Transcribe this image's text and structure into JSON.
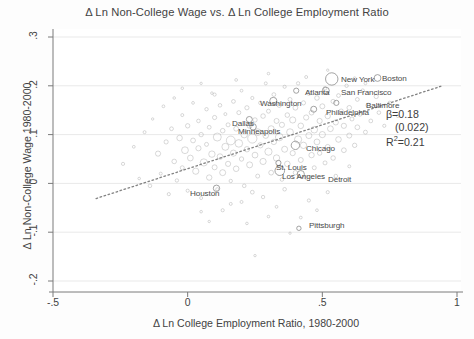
{
  "chart_data": {
    "type": "scatter",
    "title": "Δ Ln Non-College Wage vs. Δ Ln College Employment Ratio",
    "xlabel": "Δ Ln College Employment Ratio, 1980-2000",
    "ylabel": "Δ Ln Non-College Wage 1980-2000",
    "xlim": [
      -0.5,
      1.0
    ],
    "ylim": [
      -0.2,
      0.3
    ],
    "xticks": [
      "-.5",
      "0",
      ".5",
      "1"
    ],
    "xtick_values": [
      -0.5,
      0,
      0.5,
      1
    ],
    "yticks": [
      ".3",
      ".2",
      ".1",
      "0",
      "-.1",
      "-.2"
    ],
    "ytick_values": [
      0.3,
      0.2,
      0.1,
      0,
      -0.1,
      -0.2
    ],
    "grid": "horizontal",
    "legend": "none",
    "marker_style": "hollow-circle-weighted",
    "marker_color": "#9a9a9a",
    "fit_line": {
      "style": "dotted",
      "color": "#6e6e6e",
      "x0": -0.34,
      "y0": -0.031,
      "x1": 0.94,
      "y1": 0.199
    },
    "annotations": {
      "beta": "β=0.18",
      "se": "(0.022)",
      "r2_prefix": "R",
      "r2_sup": "2",
      "r2_value": "=0.21"
    },
    "labeled_points": [
      {
        "name": "New York",
        "x": 0.535,
        "y": 0.214,
        "r": 6.2,
        "lx": 341,
        "ly": 75
      },
      {
        "name": "Boston",
        "x": 0.705,
        "y": 0.216,
        "r": 3.4,
        "lx": 382,
        "ly": 74
      },
      {
        "name": "Atlanta",
        "x": 0.403,
        "y": 0.19,
        "r": 2.6,
        "lx": 305,
        "ly": 88
      },
      {
        "name": "San Francisco",
        "x": 0.513,
        "y": 0.19,
        "r": 3.5,
        "lx": 341,
        "ly": 88
      },
      {
        "name": "Washington",
        "x": 0.318,
        "y": 0.169,
        "r": 3.6,
        "lx": 260,
        "ly": 99
      },
      {
        "name": "Baltimore",
        "x": 0.552,
        "y": 0.165,
        "r": 2.6,
        "lx": 366,
        "ly": 101
      },
      {
        "name": "Philadelphia",
        "x": 0.468,
        "y": 0.152,
        "r": 3.0,
        "lx": 326,
        "ly": 108
      },
      {
        "name": "Dallas",
        "x": 0.229,
        "y": 0.131,
        "r": 3.0,
        "lx": 232,
        "ly": 119
      },
      {
        "name": "Minneapolis",
        "x": 0.243,
        "y": 0.116,
        "r": 3.2,
        "lx": 238,
        "ly": 127
      },
      {
        "name": "Chicago",
        "x": 0.4,
        "y": 0.078,
        "r": 4.2,
        "lx": 306,
        "ly": 144
      },
      {
        "name": "St. Louis",
        "x": 0.337,
        "y": 0.042,
        "r": 2.6,
        "lx": 276,
        "ly": 163
      },
      {
        "name": "Los Angeles",
        "x": 0.342,
        "y": 0.026,
        "r": 4.8,
        "lx": 282,
        "ly": 172
      },
      {
        "name": "Detroit",
        "x": 0.42,
        "y": 0.019,
        "r": 3.6,
        "lx": 328,
        "ly": 175
      },
      {
        "name": "Houston",
        "x": 0.107,
        "y": -0.01,
        "r": 3.2,
        "lx": 190,
        "ly": 189
      },
      {
        "name": "Pittsburgh",
        "x": 0.413,
        "y": -0.092,
        "r": 2.2,
        "lx": 309,
        "ly": 221
      }
    ],
    "points": [
      {
        "x": -0.24,
        "y": 0.04,
        "r": 1.6
      },
      {
        "x": -0.2,
        "y": 0.075,
        "r": 1.4
      },
      {
        "x": -0.18,
        "y": 0.01,
        "r": 1.3
      },
      {
        "x": -0.16,
        "y": 0.105,
        "r": 1.5
      },
      {
        "x": -0.14,
        "y": -0.005,
        "r": 1.8
      },
      {
        "x": -0.13,
        "y": 0.132,
        "r": 1.2
      },
      {
        "x": -0.11,
        "y": 0.061,
        "r": 2.6
      },
      {
        "x": -0.1,
        "y": 0.02,
        "r": 1.5
      },
      {
        "x": -0.09,
        "y": 0.158,
        "r": 1.4
      },
      {
        "x": -0.08,
        "y": 0.085,
        "r": 2.1
      },
      {
        "x": -0.07,
        "y": -0.022,
        "r": 1.6
      },
      {
        "x": -0.06,
        "y": 0.112,
        "r": 1.9
      },
      {
        "x": -0.05,
        "y": 0.045,
        "r": 2.3
      },
      {
        "x": -0.05,
        "y": 0.175,
        "r": 1.3
      },
      {
        "x": -0.04,
        "y": 0.006,
        "r": 1.7
      },
      {
        "x": -0.03,
        "y": 0.093,
        "r": 2.8
      },
      {
        "x": -0.02,
        "y": 0.14,
        "r": 1.5
      },
      {
        "x": -0.02,
        "y": 0.032,
        "r": 2.0
      },
      {
        "x": -0.01,
        "y": 0.068,
        "r": 3.4
      },
      {
        "x": 0.0,
        "y": 0.118,
        "r": 2.2
      },
      {
        "x": 0.0,
        "y": -0.015,
        "r": 1.6
      },
      {
        "x": 0.01,
        "y": 0.052,
        "r": 2.9
      },
      {
        "x": 0.02,
        "y": 0.165,
        "r": 1.4
      },
      {
        "x": 0.02,
        "y": 0.088,
        "r": 2.4
      },
      {
        "x": 0.03,
        "y": 0.025,
        "r": 3.1
      },
      {
        "x": 0.04,
        "y": 0.128,
        "r": 1.8
      },
      {
        "x": 0.04,
        "y": 0.072,
        "r": 2.6
      },
      {
        "x": 0.05,
        "y": -0.03,
        "r": 1.5
      },
      {
        "x": 0.05,
        "y": 0.1,
        "r": 2.2
      },
      {
        "x": 0.06,
        "y": 0.043,
        "r": 3.6
      },
      {
        "x": 0.07,
        "y": 0.152,
        "r": 1.7
      },
      {
        "x": 0.07,
        "y": 0.08,
        "r": 2.0
      },
      {
        "x": 0.08,
        "y": 0.012,
        "r": 2.7
      },
      {
        "x": 0.08,
        "y": 0.115,
        "r": 1.9
      },
      {
        "x": 0.09,
        "y": 0.06,
        "r": 3.2
      },
      {
        "x": 0.09,
        "y": 0.185,
        "r": 1.3
      },
      {
        "x": 0.1,
        "y": 0.033,
        "r": 2.5
      },
      {
        "x": 0.1,
        "y": 0.135,
        "r": 2.1
      },
      {
        "x": 0.11,
        "y": 0.095,
        "r": 4.0
      },
      {
        "x": 0.11,
        "y": -0.012,
        "r": 1.6
      },
      {
        "x": 0.12,
        "y": 0.055,
        "r": 2.8
      },
      {
        "x": 0.12,
        "y": 0.16,
        "r": 1.8
      },
      {
        "x": 0.13,
        "y": 0.108,
        "r": 2.3
      },
      {
        "x": 0.13,
        "y": 0.022,
        "r": 3.0
      },
      {
        "x": 0.14,
        "y": 0.075,
        "r": 3.5
      },
      {
        "x": 0.14,
        "y": 0.142,
        "r": 1.5
      },
      {
        "x": 0.15,
        "y": 0.04,
        "r": 2.6
      },
      {
        "x": 0.15,
        "y": 0.12,
        "r": 2.0
      },
      {
        "x": 0.16,
        "y": 0.088,
        "r": 4.4
      },
      {
        "x": 0.16,
        "y": 0.005,
        "r": 1.7
      },
      {
        "x": 0.17,
        "y": 0.168,
        "r": 1.9
      },
      {
        "x": 0.17,
        "y": 0.062,
        "r": 3.1
      },
      {
        "x": 0.18,
        "y": 0.112,
        "r": 2.4
      },
      {
        "x": 0.18,
        "y": 0.03,
        "r": 2.8
      },
      {
        "x": 0.19,
        "y": 0.145,
        "r": 2.0
      },
      {
        "x": 0.19,
        "y": 0.082,
        "r": 3.8
      },
      {
        "x": 0.2,
        "y": 0.05,
        "r": 2.2
      },
      {
        "x": 0.2,
        "y": 0.19,
        "r": 1.4
      },
      {
        "x": 0.21,
        "y": 0.1,
        "r": 3.3
      },
      {
        "x": 0.21,
        "y": -0.005,
        "r": 1.8
      },
      {
        "x": 0.22,
        "y": 0.07,
        "r": 2.7
      },
      {
        "x": 0.22,
        "y": 0.155,
        "r": 2.1
      },
      {
        "x": 0.23,
        "y": 0.118,
        "r": 2.5
      },
      {
        "x": 0.23,
        "y": 0.038,
        "r": 3.0
      },
      {
        "x": 0.24,
        "y": 0.092,
        "r": 4.6
      },
      {
        "x": 0.24,
        "y": 0.175,
        "r": 1.6
      },
      {
        "x": 0.25,
        "y": 0.058,
        "r": 2.9
      },
      {
        "x": 0.25,
        "y": 0.13,
        "r": 2.2
      },
      {
        "x": 0.26,
        "y": 0.015,
        "r": 2.0
      },
      {
        "x": 0.26,
        "y": 0.105,
        "r": 3.4
      },
      {
        "x": 0.27,
        "y": 0.165,
        "r": 1.8
      },
      {
        "x": 0.27,
        "y": 0.078,
        "r": 2.6
      },
      {
        "x": 0.28,
        "y": 0.045,
        "r": 3.1
      },
      {
        "x": 0.28,
        "y": 0.138,
        "r": 2.3
      },
      {
        "x": 0.29,
        "y": 0.098,
        "r": 2.8
      },
      {
        "x": 0.29,
        "y": 0.205,
        "r": 1.5
      },
      {
        "x": 0.3,
        "y": 0.065,
        "r": 3.6
      },
      {
        "x": 0.3,
        "y": 0.148,
        "r": 2.0
      },
      {
        "x": 0.31,
        "y": 0.022,
        "r": 2.4
      },
      {
        "x": 0.31,
        "y": 0.112,
        "r": 3.0
      },
      {
        "x": 0.32,
        "y": 0.182,
        "r": 1.9
      },
      {
        "x": 0.32,
        "y": 0.085,
        "r": 2.7
      },
      {
        "x": 0.33,
        "y": 0.128,
        "r": 2.5
      },
      {
        "x": 0.33,
        "y": 0.052,
        "r": 3.2
      },
      {
        "x": 0.34,
        "y": 0.16,
        "r": 2.1
      },
      {
        "x": 0.34,
        "y": 0.095,
        "r": 3.8
      },
      {
        "x": 0.35,
        "y": 0.008,
        "r": 1.8
      },
      {
        "x": 0.35,
        "y": 0.12,
        "r": 2.6
      },
      {
        "x": 0.36,
        "y": 0.198,
        "r": 1.6
      },
      {
        "x": 0.36,
        "y": 0.07,
        "r": 3.0
      },
      {
        "x": 0.37,
        "y": 0.14,
        "r": 2.3
      },
      {
        "x": 0.37,
        "y": 0.04,
        "r": 2.8
      },
      {
        "x": 0.38,
        "y": 0.105,
        "r": 3.4
      },
      {
        "x": 0.38,
        "y": 0.172,
        "r": 2.0
      },
      {
        "x": 0.39,
        "y": 0.062,
        "r": 2.6
      },
      {
        "x": 0.39,
        "y": 0.13,
        "r": 3.1
      },
      {
        "x": 0.4,
        "y": 0.022,
        "r": 2.2
      },
      {
        "x": 0.4,
        "y": 0.155,
        "r": 2.4
      },
      {
        "x": 0.41,
        "y": 0.09,
        "r": 3.6
      },
      {
        "x": 0.41,
        "y": 0.205,
        "r": 1.7
      },
      {
        "x": 0.42,
        "y": 0.118,
        "r": 2.8
      },
      {
        "x": 0.42,
        "y": 0.048,
        "r": 2.5
      },
      {
        "x": 0.43,
        "y": 0.165,
        "r": 2.1
      },
      {
        "x": 0.43,
        "y": 0.078,
        "r": 3.2
      },
      {
        "x": 0.44,
        "y": 0.135,
        "r": 2.6
      },
      {
        "x": 0.44,
        "y": 0.012,
        "r": 1.9
      },
      {
        "x": 0.45,
        "y": 0.098,
        "r": 3.0
      },
      {
        "x": 0.45,
        "y": 0.185,
        "r": 2.2
      },
      {
        "x": 0.46,
        "y": 0.058,
        "r": 2.7
      },
      {
        "x": 0.46,
        "y": 0.145,
        "r": 2.4
      },
      {
        "x": 0.47,
        "y": 0.11,
        "r": 3.3
      },
      {
        "x": 0.47,
        "y": 0.032,
        "r": 2.0
      },
      {
        "x": 0.48,
        "y": 0.175,
        "r": 2.3
      },
      {
        "x": 0.48,
        "y": 0.085,
        "r": 2.9
      },
      {
        "x": 0.49,
        "y": 0.128,
        "r": 2.6
      },
      {
        "x": 0.49,
        "y": 0.062,
        "r": 2.2
      },
      {
        "x": 0.5,
        "y": 0.158,
        "r": 2.5
      },
      {
        "x": 0.5,
        "y": 0.1,
        "r": 3.1
      },
      {
        "x": 0.51,
        "y": 0.042,
        "r": 2.0
      },
      {
        "x": 0.51,
        "y": 0.195,
        "r": 1.8
      },
      {
        "x": 0.52,
        "y": 0.138,
        "r": 2.7
      },
      {
        "x": 0.52,
        "y": 0.075,
        "r": 2.4
      },
      {
        "x": 0.53,
        "y": 0.112,
        "r": 2.9
      },
      {
        "x": 0.54,
        "y": 0.168,
        "r": 2.1
      },
      {
        "x": 0.54,
        "y": 0.052,
        "r": 2.3
      },
      {
        "x": 0.55,
        "y": 0.125,
        "r": 2.6
      },
      {
        "x": 0.56,
        "y": 0.09,
        "r": 2.8
      },
      {
        "x": 0.56,
        "y": 0.18,
        "r": 1.9
      },
      {
        "x": 0.57,
        "y": 0.148,
        "r": 2.2
      },
      {
        "x": 0.58,
        "y": 0.068,
        "r": 2.4
      },
      {
        "x": 0.58,
        "y": 0.118,
        "r": 2.6
      },
      {
        "x": 0.59,
        "y": 0.2,
        "r": 1.7
      },
      {
        "x": 0.6,
        "y": 0.155,
        "r": 2.3
      },
      {
        "x": 0.6,
        "y": 0.098,
        "r": 2.5
      },
      {
        "x": 0.61,
        "y": 0.132,
        "r": 2.0
      },
      {
        "x": 0.62,
        "y": 0.078,
        "r": 2.2
      },
      {
        "x": 0.63,
        "y": 0.172,
        "r": 1.9
      },
      {
        "x": 0.63,
        "y": 0.115,
        "r": 2.4
      },
      {
        "x": 0.64,
        "y": 0.142,
        "r": 2.1
      },
      {
        "x": 0.65,
        "y": 0.19,
        "r": 1.8
      },
      {
        "x": 0.66,
        "y": 0.105,
        "r": 2.0
      },
      {
        "x": 0.67,
        "y": 0.16,
        "r": 2.2
      },
      {
        "x": 0.68,
        "y": 0.128,
        "r": 1.9
      },
      {
        "x": 0.7,
        "y": 0.178,
        "r": 2.1
      },
      {
        "x": 0.71,
        "y": 0.145,
        "r": 1.8
      },
      {
        "x": 0.73,
        "y": 0.118,
        "r": 1.6
      },
      {
        "x": 0.75,
        "y": 0.165,
        "r": 1.7
      },
      {
        "x": 0.78,
        "y": 0.138,
        "r": 1.5
      },
      {
        "x": 0.13,
        "y": -0.055,
        "r": 1.6
      },
      {
        "x": 0.2,
        "y": -0.038,
        "r": 1.5
      },
      {
        "x": 0.28,
        "y": -0.028,
        "r": 1.7
      },
      {
        "x": 0.33,
        "y": -0.048,
        "r": 1.4
      },
      {
        "x": 0.45,
        "y": -0.035,
        "r": 1.6
      },
      {
        "x": 0.36,
        "y": -0.012,
        "r": 1.8
      },
      {
        "x": 0.24,
        "y": -0.018,
        "r": 1.9
      },
      {
        "x": 0.16,
        "y": -0.042,
        "r": 1.5
      },
      {
        "x": 0.05,
        "y": -0.058,
        "r": 1.3
      },
      {
        "x": 0.42,
        "y": -0.07,
        "r": 1.4
      },
      {
        "x": 0.52,
        "y": -0.018,
        "r": 1.6
      },
      {
        "x": 0.55,
        "y": 0.015,
        "r": 1.8
      },
      {
        "x": 0.3,
        "y": -0.068,
        "r": 1.3
      },
      {
        "x": 0.38,
        "y": -0.102,
        "r": 1.2
      },
      {
        "x": 0.22,
        "y": -0.082,
        "r": 1.3
      },
      {
        "x": 0.48,
        "y": -0.055,
        "r": 1.4
      },
      {
        "x": 0.08,
        "y": -0.078,
        "r": 1.2
      },
      {
        "x": 0.6,
        "y": 0.035,
        "r": 1.5
      },
      {
        "x": 0.62,
        "y": 0.215,
        "r": 1.6
      },
      {
        "x": 0.66,
        "y": 0.205,
        "r": 1.4
      },
      {
        "x": 0.44,
        "y": 0.218,
        "r": 1.5
      },
      {
        "x": 0.3,
        "y": 0.225,
        "r": 1.3
      },
      {
        "x": 0.18,
        "y": 0.212,
        "r": 1.4
      },
      {
        "x": 0.52,
        "y": 0.232,
        "r": 1.2
      },
      {
        "x": -0.02,
        "y": 0.195,
        "r": 1.3
      },
      {
        "x": 0.1,
        "y": 0.182,
        "r": 1.6
      },
      {
        "x": 0.25,
        "y": -0.148,
        "r": 1.2
      },
      {
        "x": 0.05,
        "y": 0.205,
        "r": 1.2
      }
    ]
  }
}
